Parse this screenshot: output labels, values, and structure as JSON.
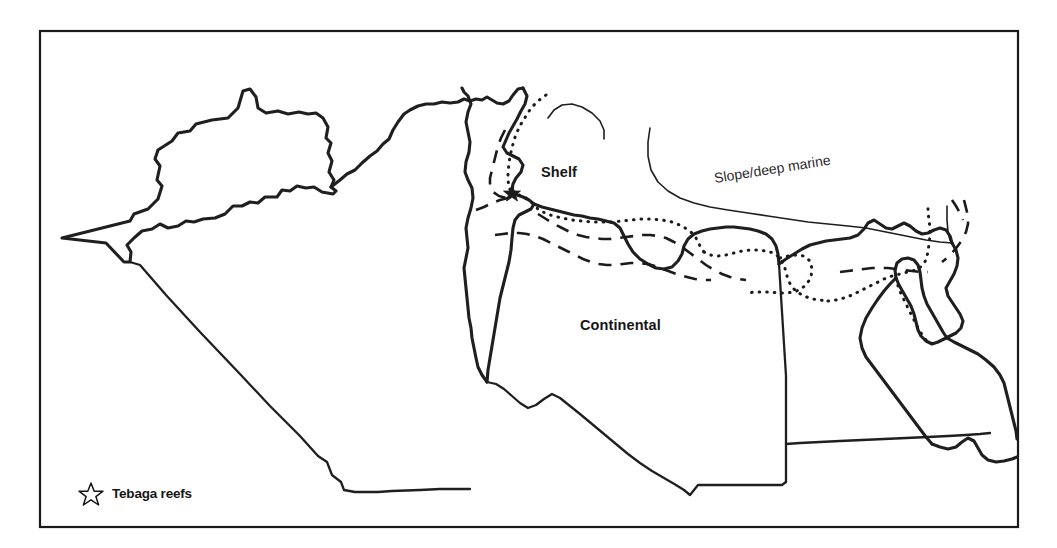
{
  "figure": {
    "type": "paleogeographic-facies-map",
    "region": "North Africa and eastern Mediterranean",
    "background_color": "#ffffff",
    "line_color": "#1f1f1f",
    "frame": {
      "x": 40,
      "y": 31,
      "width": 978,
      "height": 496
    }
  },
  "labels": {
    "shelf": "Shelf",
    "continental": "Continental",
    "slope_deep_marine": "Slope/deep marine"
  },
  "legend": {
    "symbol": "open-star",
    "text": "Tebaga reefs"
  },
  "facies_lines": {
    "dotted_label": "dotted facies boundary",
    "dashed_label": "dashed facies boundary",
    "shelf_edge_label": "shelf edge line"
  },
  "markers": [
    {
      "name": "tebaga-reefs-site",
      "symbol": "star",
      "x": 512,
      "y": 192
    }
  ]
}
